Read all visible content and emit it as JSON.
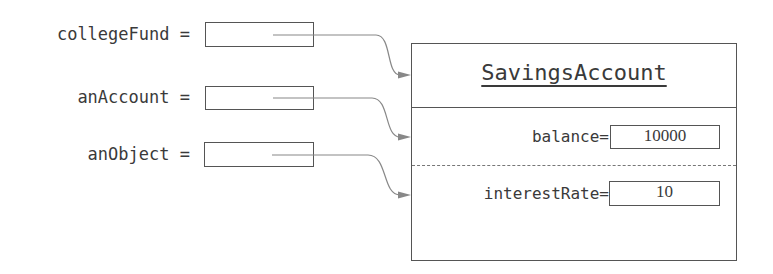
{
  "variables": [
    {
      "name": "collegeFund",
      "operator": "="
    },
    {
      "name": "anAccount",
      "operator": "="
    },
    {
      "name": "anObject",
      "operator": "="
    }
  ],
  "object": {
    "class_name": "SavingsAccount",
    "fields": [
      {
        "name": "balance",
        "operator": "=",
        "value": "10000"
      },
      {
        "name": "interestRate",
        "operator": "=",
        "value": "10"
      }
    ]
  },
  "colors": {
    "line": "#555555",
    "arrow": "#888888",
    "text": "#3a3a3a"
  }
}
